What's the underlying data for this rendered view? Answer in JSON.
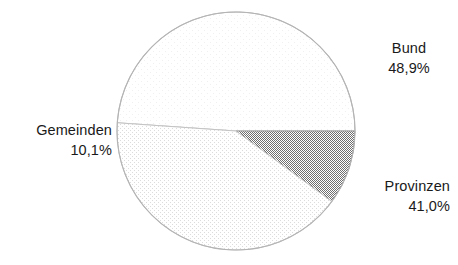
{
  "chart_data": {
    "type": "pie",
    "title": "",
    "subtitle": "",
    "xlabel": "",
    "ylabel": "",
    "legend_position": "none",
    "grid": false,
    "labels_outside": true,
    "categories": [
      "Bund",
      "Provinzen",
      "Gemeinden"
    ],
    "values": [
      48.9,
      41.0,
      10.1
    ],
    "value_labels": [
      "48,9%",
      "41,0%",
      "10,1%"
    ],
    "colors": [
      "#fdfdfd",
      "#f1f1f1",
      "#9b9b9b"
    ],
    "slices": [
      {
        "name": "Bund",
        "value": 48.9,
        "value_label": "48,9%",
        "color": "#fdfdfd",
        "label_name": "Bund",
        "label_value": "48,9%"
      },
      {
        "name": "Provinzen",
        "value": 41.0,
        "value_label": "41,0%",
        "color": "#f1f1f1",
        "label_name": "Provinzen",
        "label_value": "41,0%"
      },
      {
        "name": "Gemeinden",
        "value": 10.1,
        "value_label": "10,1%",
        "color": "#9b9b9b",
        "label_name": "Gemeinden",
        "label_value": "10,1%"
      }
    ],
    "geometry": {
      "center_x": 236,
      "center_y": 131,
      "radius": 119,
      "start_angle_deg": 0,
      "direction": "counterclockwise"
    },
    "stroke_color": "#b4b4b4"
  }
}
